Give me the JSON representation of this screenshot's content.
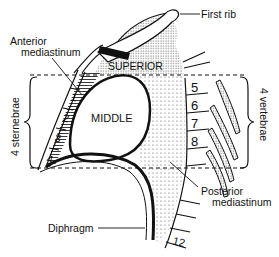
{
  "diagram": {
    "labels": {
      "first_rib": "First rib",
      "anterior_mediastinum_line1": "Anterior",
      "anterior_mediastinum_line2": "mediastinum",
      "superior": "SUPERIOR",
      "middle": "MIDDLE",
      "sternebrae": "4 sternebrae",
      "vertebrae": "4 vertebrae",
      "diaphragm": "Diphragm",
      "posterior_mediastinum_line1": "Posterior",
      "posterior_mediastinum_line2": "mediastinum"
    },
    "sternebrae_numbers": [
      "1",
      "2",
      "3",
      "4"
    ],
    "vertebrae_numbers": [
      "5",
      "6",
      "7",
      "8"
    ],
    "lower_vertebra_number": "12",
    "colors": {
      "line": "#111111",
      "stipple": "#555555",
      "background": "#ffffff"
    }
  }
}
